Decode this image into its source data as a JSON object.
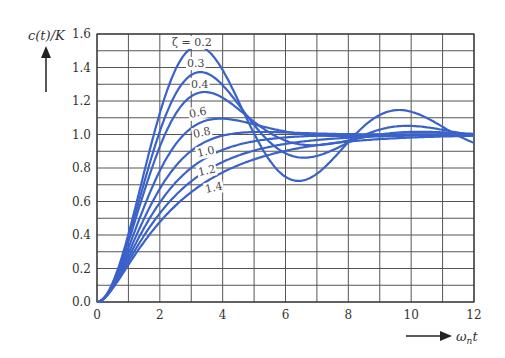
{
  "chart_data": {
    "type": "line",
    "title": "",
    "ylabel": "c(t)/K",
    "xlabel": "ω_n t",
    "xlim": [
      0,
      12
    ],
    "ylim": [
      0,
      1.6
    ],
    "xticks": [
      "0",
      "2",
      "4",
      "6",
      "8",
      "10",
      "12"
    ],
    "yticks": [
      "0.0",
      "0.2",
      "0.4",
      "0.6",
      "0.8",
      "1.0",
      "1.2",
      "1.4",
      "1.6"
    ],
    "grid": true,
    "minor_grid": {
      "x_step": 1,
      "y_step": 0.1
    },
    "legend": "inline labels",
    "line_color": "#3a62c9",
    "x": [
      0,
      1,
      2,
      3,
      4,
      5,
      6,
      7,
      8,
      9,
      10,
      11,
      12
    ],
    "series": [
      {
        "name": "ζ = 0.2",
        "zeta": 0.2,
        "label": "ζ = 0.2",
        "values": [
          0,
          0.45,
          1.18,
          1.52,
          1.35,
          0.97,
          0.74,
          0.79,
          1.0,
          1.14,
          1.12,
          1.03,
          0.96
        ]
      },
      {
        "name": "0.3",
        "zeta": 0.3,
        "label": "0.3",
        "values": [
          0,
          0.44,
          1.12,
          1.37,
          1.26,
          1.04,
          0.89,
          0.89,
          0.97,
          1.05,
          1.05,
          1.01,
          0.98
        ]
      },
      {
        "name": "0.4",
        "zeta": 0.4,
        "label": "0.4",
        "values": [
          0,
          0.42,
          1.05,
          1.25,
          1.17,
          1.04,
          0.97,
          0.96,
          0.99,
          1.01,
          1.01,
          1.0,
          1.0
        ]
      },
      {
        "name": "0.6",
        "zeta": 0.6,
        "label": "0.6",
        "values": [
          0,
          0.4,
          0.93,
          1.09,
          1.07,
          1.03,
          1.0,
          0.99,
          1.0,
          1.0,
          1.0,
          1.0,
          1.0
        ]
      },
      {
        "name": "0.8",
        "zeta": 0.8,
        "label": "0.8",
        "values": [
          0,
          0.37,
          0.83,
          1.0,
          1.02,
          1.01,
          1.0,
          1.0,
          1.0,
          1.0,
          1.0,
          1.0,
          1.0
        ]
      },
      {
        "name": "1.0",
        "zeta": 1.0,
        "label": "1.0",
        "values": [
          0,
          0.26,
          0.59,
          0.8,
          0.91,
          0.96,
          0.98,
          0.99,
          1.0,
          1.0,
          1.0,
          1.0,
          1.0
        ]
      },
      {
        "name": "1.2",
        "zeta": 1.2,
        "label": "1.2",
        "values": [
          0,
          0.24,
          0.52,
          0.71,
          0.83,
          0.9,
          0.94,
          0.97,
          0.98,
          0.99,
          0.99,
          1.0,
          1.0
        ]
      },
      {
        "name": "1.4",
        "zeta": 1.4,
        "label": "1.4",
        "values": [
          0,
          0.22,
          0.46,
          0.63,
          0.75,
          0.83,
          0.89,
          0.93,
          0.95,
          0.97,
          0.98,
          0.99,
          0.99
        ]
      }
    ]
  }
}
